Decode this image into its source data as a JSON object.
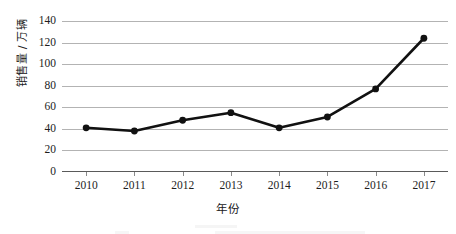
{
  "chart_data": {
    "type": "line",
    "title": "",
    "xlabel": "年份",
    "ylabel": "销售量 / 万辆",
    "categories": [
      "2010",
      "2011",
      "2012",
      "2013",
      "2014",
      "2015",
      "2016",
      "2017"
    ],
    "values": [
      41,
      38,
      48,
      55,
      41,
      51,
      77,
      124
    ],
    "series": [
      {
        "name": "销售量",
        "values": [
          41,
          38,
          48,
          55,
          41,
          51,
          77,
          124
        ]
      }
    ],
    "ylim": [
      0,
      140
    ],
    "yticks": [
      0,
      20,
      40,
      60,
      80,
      100,
      120,
      140
    ],
    "ytick_labels": [
      "0",
      "20",
      "40",
      "60",
      "80",
      "100",
      "120",
      "140"
    ],
    "grid": true,
    "grid_orientation": "horizontal",
    "legend": false,
    "legend_position": "none",
    "marker": "circle",
    "line_color": "#111111",
    "marker_color": "#111111",
    "grid_color": "#b3b3b3",
    "background_color": "#ffffff"
  },
  "axes": {
    "y_label": "销售量 / 万辆",
    "x_label": "年份",
    "y_tick_labels": [
      "140",
      "120",
      "100",
      "80",
      "60",
      "40",
      "20",
      "0"
    ],
    "x_tick_labels": [
      "2010",
      "2011",
      "2012",
      "2013",
      "2014",
      "2015",
      "2016",
      "2017"
    ]
  }
}
